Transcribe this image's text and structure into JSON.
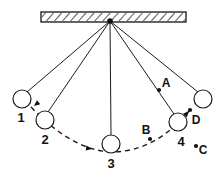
{
  "diagram": {
    "type": "pendulum-swing-diagram",
    "canvas": {
      "width": 217,
      "height": 175
    },
    "colors": {
      "ink": "#1b1b1b",
      "fill": "#ffffff",
      "dot": "#111111"
    },
    "ceiling": {
      "name": "hatched-support-bar",
      "x": 41,
      "y": 12,
      "width": 145,
      "height": 10,
      "hatch": "diagonal"
    },
    "pivot": {
      "label": "",
      "x": 110,
      "y": 21
    },
    "bobs": [
      {
        "label": "1",
        "cx": 22,
        "cy": 99,
        "r": 9,
        "label_x": 21,
        "label_y": 122
      },
      {
        "label": "2",
        "cx": 45,
        "cy": 120,
        "r": 9,
        "label_x": 45,
        "label_y": 144
      },
      {
        "label": "3",
        "cx": 111,
        "cy": 144,
        "r": 9,
        "label_x": 111,
        "label_y": 168
      },
      {
        "label": "4",
        "cx": 178,
        "cy": 122,
        "r": 9,
        "label_x": 181,
        "label_y": 146
      },
      {
        "label": "",
        "cx": 203,
        "cy": 99,
        "r": 9,
        "label_x": 0,
        "label_y": 0
      }
    ],
    "points": [
      {
        "label": "A",
        "dot_x": 159,
        "dot_y": 90,
        "label_x": 166,
        "label_y": 87,
        "r": 2.1
      },
      {
        "label": "B",
        "dot_x": 150,
        "dot_y": 139,
        "label_x": 146,
        "label_y": 134,
        "r": 2.1
      },
      {
        "label": "C",
        "dot_x": 196,
        "dot_y": 146,
        "label_x": 203,
        "label_y": 154,
        "r": 2.1
      },
      {
        "label": "D",
        "dot_x": 190,
        "dot_y": 110,
        "label_x": 196,
        "label_y": 124,
        "r": 2.1
      }
    ],
    "strings": [
      {
        "name": "string-to-bob-1",
        "x1": 110,
        "y1": 21,
        "x2": 27,
        "y2": 92
      },
      {
        "name": "string-to-bob-2",
        "x1": 110,
        "y1": 21,
        "x2": 48,
        "y2": 112
      },
      {
        "name": "string-to-bob-3",
        "x1": 110,
        "y1": 21,
        "x2": 111,
        "y2": 135
      },
      {
        "name": "string-to-bob-4",
        "x1": 110,
        "y1": 21,
        "x2": 174,
        "y2": 114
      },
      {
        "name": "string-to-bob-5",
        "x1": 110,
        "y1": 21,
        "x2": 198,
        "y2": 92
      }
    ],
    "arc": {
      "name": "swing-path-arc",
      "d": "M 31 107 Q 72 150 111 152 Q 155 152 189 111",
      "style": "dashed"
    },
    "arrows": [
      {
        "name": "arrow-toward-bob-2",
        "x": 34,
        "y": 106,
        "angle": 140
      },
      {
        "name": "arrow-toward-bob-3",
        "x": 92,
        "y": 149,
        "angle": 10
      },
      {
        "name": "arrow-toward-point-d",
        "x": 189,
        "y": 111,
        "angle": -48
      }
    ]
  }
}
